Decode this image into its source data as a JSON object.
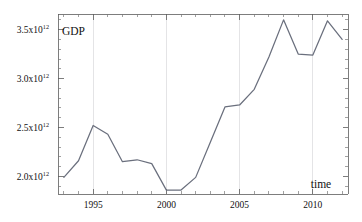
{
  "chart_data": {
    "type": "line",
    "title": "",
    "xlabel": "time",
    "ylabel": "GDP",
    "xlim": [
      1992.6,
      2012.4
    ],
    "ylim": [
      1820000000000.0,
      3660000000000.0
    ],
    "grid": true,
    "legend": null,
    "x_major_ticks": [
      1995,
      2000,
      2005,
      2010
    ],
    "x_major_tick_labels": [
      "1995",
      "2000",
      "2005",
      "2010"
    ],
    "x_minor_ticks": [
      1993,
      1994,
      1996,
      1997,
      1998,
      1999,
      2001,
      2002,
      2003,
      2004,
      2006,
      2007,
      2008,
      2009,
      2011,
      2012
    ],
    "y_major_ticks": [
      2000000000000.0,
      2500000000000.0,
      3000000000000.0,
      3500000000000.0
    ],
    "y_major_tick_labels": [
      "2.0x10",
      "2.5x10",
      "3.0x10",
      "3.5x10"
    ],
    "y_major_tick_exponents": [
      "12",
      "12",
      "12",
      "12"
    ],
    "y_minor_ticks": [
      1900000000000.0,
      2100000000000.0,
      2200000000000.0,
      2300000000000.0,
      2400000000000.0,
      2600000000000.0,
      2700000000000.0,
      2800000000000.0,
      2900000000000.0,
      3100000000000.0,
      3200000000000.0,
      3300000000000.0,
      3400000000000.0,
      3600000000000.0
    ],
    "series": [
      {
        "name": "GDP",
        "color": "#6a6f7d",
        "x": [
          1993,
          1994,
          1995,
          1996,
          1997,
          1998,
          1999,
          2000,
          2001,
          2002,
          2003,
          2004,
          2005,
          2006,
          2007,
          2008,
          2009,
          2010,
          2011,
          2012
        ],
        "values": [
          1990000000000.0,
          2160000000000.0,
          2520000000000.0,
          2430000000000.0,
          2150000000000.0,
          2170000000000.0,
          2130000000000.0,
          1860000000000.0,
          1860000000000.0,
          1990000000000.0,
          2350000000000.0,
          2710000000000.0,
          2730000000000.0,
          2890000000000.0,
          3220000000000.0,
          3600000000000.0,
          3250000000000.0,
          3240000000000.0,
          3590000000000.0,
          3400000000000.0
        ]
      }
    ]
  },
  "labels": {
    "y_axis_title": "GDP",
    "x_axis_title": "time"
  }
}
